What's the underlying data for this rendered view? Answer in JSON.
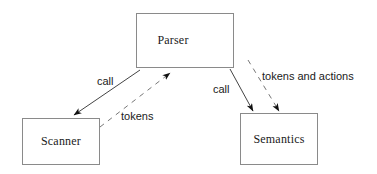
{
  "diagram": {
    "background_color": "#ffffff",
    "line_color": "#1a1a1a",
    "box_border_color": "#8a8a8a",
    "nodes": [
      {
        "id": "parser",
        "label": "Parser",
        "x": 136,
        "y": 13,
        "w": 98,
        "h": 55
      },
      {
        "id": "scanner",
        "label": "Scanner",
        "x": 22,
        "y": 118,
        "w": 78,
        "h": 47
      },
      {
        "id": "semantics",
        "label": "Semantics",
        "x": 240,
        "y": 113,
        "w": 78,
        "h": 52
      }
    ],
    "edges": [
      {
        "id": "parser-to-scanner-call",
        "label": "call",
        "style": "solid",
        "from": "parser",
        "to": "scanner"
      },
      {
        "id": "scanner-to-parser-tokens",
        "label": "tokens",
        "style": "dashed",
        "from": "scanner",
        "to": "parser"
      },
      {
        "id": "parser-to-semantics-call",
        "label": "call",
        "style": "solid",
        "from": "parser",
        "to": "semantics"
      },
      {
        "id": "parser-to-semantics-tokens",
        "label": "tokens and actions",
        "style": "dashed",
        "from": "parser",
        "to": "semantics"
      }
    ],
    "labels": {
      "call_left": "call",
      "tokens_left": "tokens",
      "call_right": "call",
      "tokens_actions_right": "tokens and actions"
    }
  }
}
